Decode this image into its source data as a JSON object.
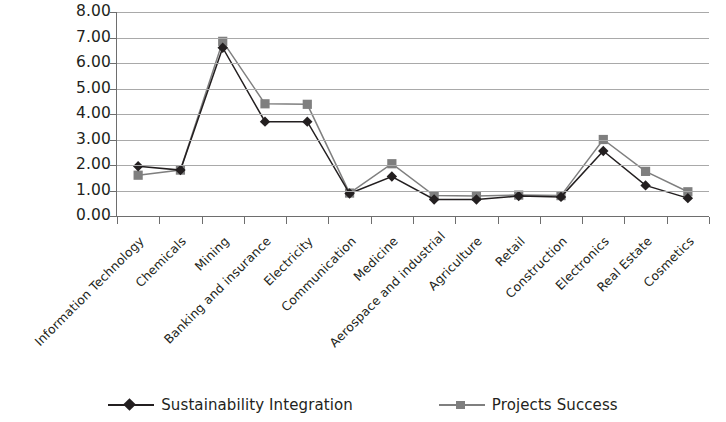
{
  "chart_data": {
    "type": "line",
    "title": "",
    "xlabel": "",
    "ylabel": "",
    "ylim": [
      0,
      8
    ],
    "ytick_step": 1,
    "ytick_labels": [
      "8.00",
      "7.00",
      "6.00",
      "5.00",
      "4.00",
      "3.00",
      "2.00",
      "1.00",
      "0.00"
    ],
    "grid": true,
    "legend_position": "bottom-center",
    "categories": [
      "Information Technology",
      "Chemicals",
      "Mining",
      "Banking and insurance",
      "Electricity",
      "Communication",
      "Medicine",
      "Aerospace and industrial",
      "Agriculture",
      "Retail",
      "Construction",
      "Electronics",
      "Real Estate",
      "Cosmetics"
    ],
    "series": [
      {
        "name": "Sustainability Integration",
        "marker": "diamond",
        "color": "#231f20",
        "values": [
          1.95,
          1.8,
          6.6,
          3.7,
          3.7,
          0.88,
          1.55,
          0.65,
          0.65,
          0.78,
          0.75,
          2.55,
          1.2,
          0.7
        ]
      },
      {
        "name": "Projects Success",
        "marker": "square",
        "color": "#7f7f7f",
        "values": [
          1.6,
          1.8,
          6.85,
          4.4,
          4.38,
          0.9,
          2.05,
          0.8,
          0.78,
          0.82,
          0.8,
          3.0,
          1.75,
          0.95
        ]
      }
    ]
  },
  "legend": {
    "items": [
      {
        "label": "Sustainability Integration",
        "marker": "diamond-marker-icon"
      },
      {
        "label": "Projects Success",
        "marker": "square-marker-icon"
      }
    ]
  }
}
